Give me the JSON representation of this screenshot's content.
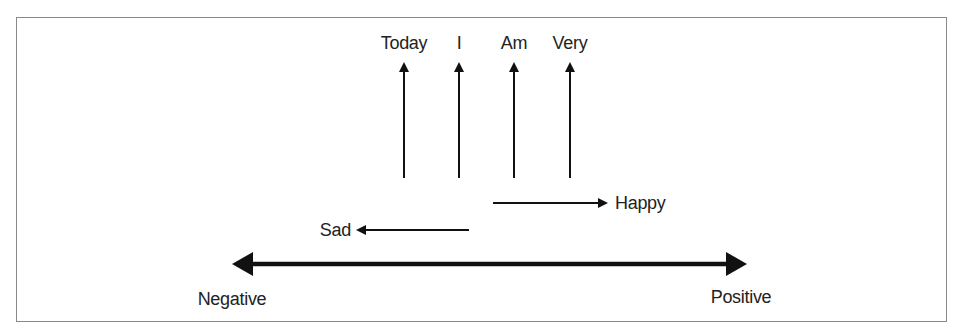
{
  "diagram": {
    "word_labels": [
      {
        "text": "Today",
        "x": 404
      },
      {
        "text": "I",
        "x": 459
      },
      {
        "text": "Am",
        "x": 514
      },
      {
        "text": "Very",
        "x": 570
      }
    ],
    "sentiment_words": {
      "positive_word": "Happy",
      "negative_word": "Sad"
    },
    "axis": {
      "left_label": "Negative",
      "right_label": "Positive"
    },
    "colors": {
      "stroke": "#111111",
      "text": "#222222",
      "border": "#8a8a8a"
    }
  }
}
